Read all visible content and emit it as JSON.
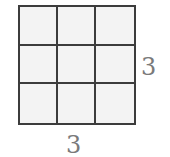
{
  "diagram": {
    "type": "grid",
    "rows": 3,
    "columns": 3,
    "labels": {
      "height": "3",
      "width": "3"
    },
    "colors": {
      "line": "#3c3c3c",
      "cell_fill": "#f3f3f3",
      "label": "#7a7a7a"
    }
  }
}
